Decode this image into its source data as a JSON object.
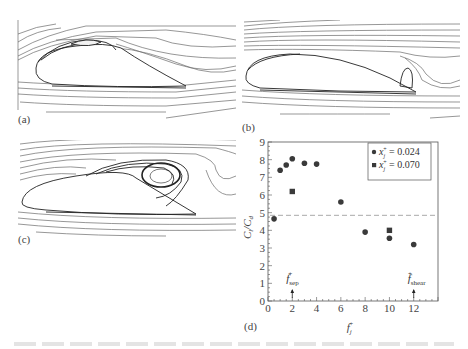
{
  "panels": [
    {
      "id": "a",
      "label": "(a)",
      "description": "streamlines around airfoil, small leading-edge bubble"
    },
    {
      "id": "b",
      "label": "(b)",
      "description": "streamlines around airfoil, small trailing-edge vortex"
    },
    {
      "id": "c",
      "label": "(c)",
      "description": "streamlines around airfoil, large separation vortex"
    },
    {
      "id": "d",
      "label": "(d)",
      "description": "lift-to-drag ratio vs forcing frequency"
    }
  ],
  "colors": {
    "streamline": "#6a6a6a",
    "streamline_dark": "#222222",
    "marker": "#3a3a3a",
    "axis": "#555555",
    "dashed_line": "#aaaaaa"
  },
  "chart_data": {
    "type": "scatter",
    "title": "",
    "xlabel": "f_j^+",
    "ylabel": "C_l/C_d",
    "xlim": [
      0,
      14
    ],
    "ylim": [
      0,
      9
    ],
    "xticks": [
      0,
      2,
      4,
      6,
      8,
      10,
      12
    ],
    "yticks": [
      0,
      1,
      2,
      3,
      4,
      5,
      6,
      7,
      8,
      9
    ],
    "grid": false,
    "legend_position": "upper right",
    "series": [
      {
        "name": "x_j^+ = 0.024",
        "marker": "circle",
        "x": [
          0.5,
          1,
          1.5,
          2,
          3,
          4,
          6,
          8,
          10,
          12
        ],
        "y": [
          4.65,
          7.4,
          7.7,
          8.05,
          7.8,
          7.75,
          5.6,
          3.9,
          3.55,
          3.2
        ]
      },
      {
        "name": "x_j^+ = 0.070",
        "marker": "square",
        "x": [
          2,
          10
        ],
        "y": [
          6.2,
          4.0
        ]
      }
    ],
    "reference_line": {
      "type": "horizontal",
      "style": "dashed",
      "y": 4.85
    },
    "annotations": [
      {
        "text": "f_sep^+",
        "x": 2,
        "arrow": true
      },
      {
        "text": "f_shear^+",
        "x": 12,
        "arrow": true
      }
    ],
    "legend": [
      {
        "symbol": "circle",
        "var": "x",
        "sub": "j",
        "sup": "+",
        "value": "= 0.024"
      },
      {
        "symbol": "square",
        "var": "x",
        "sub": "j",
        "sup": "+",
        "value": "= 0.070"
      }
    ]
  }
}
